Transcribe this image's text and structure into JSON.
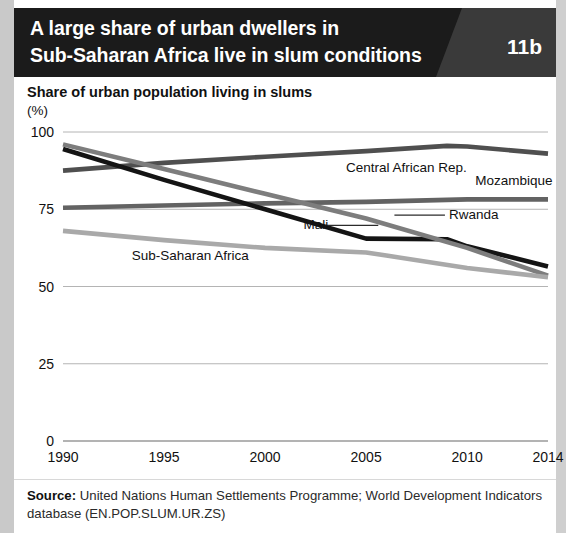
{
  "header": {
    "title_line_1": "A large share of urban dwellers in",
    "title_line_2": "Sub-Saharan Africa live in slum conditions",
    "figure_number": "11b",
    "bar_color": "#1b1b1b",
    "badge_color": "#3a3a3a",
    "text_color": "#ffffff"
  },
  "subtitle": "Share of urban population living in slums",
  "unit": "(%)",
  "source": {
    "label": "Source:",
    "text": " United Nations Human Settlements Programme; World Development Indicators database (EN.POP.SLUM.UR.ZS)"
  },
  "chart_data": {
    "type": "line",
    "title": "Share of urban population living in slums",
    "xlabel": "",
    "ylabel": "(%)",
    "ylim": [
      0,
      100
    ],
    "yticks": [
      0,
      25,
      50,
      75,
      100
    ],
    "xlim": [
      1990,
      2014
    ],
    "xticks": [
      1990,
      1995,
      2000,
      2005,
      2010,
      2014
    ],
    "grid": true,
    "legend": "inline-labels",
    "x": [
      1990,
      1995,
      2000,
      2005,
      2010,
      2014
    ],
    "series": [
      {
        "name": "Central African Rep.",
        "color": "#4f4f4f",
        "label_x": 2004.0,
        "label_y": 87.0,
        "values": [
          87.5,
          90.0,
          92.0,
          93.8,
          95.4,
          93.0
        ],
        "detail_x": [
          1990,
          1995,
          2000,
          2005,
          2009,
          2010,
          2014
        ],
        "detail_y": [
          87.5,
          90.0,
          92.0,
          93.8,
          95.5,
          95.3,
          93.0
        ]
      },
      {
        "name": "Mozambique",
        "color": "#636363",
        "label_x": 2010.4,
        "label_y": 83.0,
        "values": [
          75.5,
          76.2,
          76.9,
          77.4,
          78.2,
          78.2
        ],
        "detail_x": [
          1990,
          1995,
          2000,
          2005,
          2010,
          2014
        ],
        "detail_y": [
          75.5,
          76.2,
          76.9,
          77.4,
          78.2,
          78.2
        ]
      },
      {
        "name": "Mali",
        "color": "#141414",
        "label_x": 2001.9,
        "label_y": 68.5,
        "values": [
          94.5,
          84.5,
          75.0,
          65.5,
          65.2,
          56.5
        ],
        "detail_x": [
          1990,
          1995,
          2000,
          2005,
          2009,
          2010,
          2014
        ],
        "detail_y": [
          94.5,
          84.5,
          75.0,
          65.5,
          65.3,
          63.0,
          56.5
        ]
      },
      {
        "name": "Rwanda",
        "color": "#7d7d7d",
        "label_x": 2009.1,
        "label_y": 71.8,
        "values": [
          96.0,
          88.0,
          80.0,
          72.0,
          62.5,
          53.5
        ],
        "detail_x": [
          1990,
          1995,
          2000,
          2005,
          2010,
          2014
        ],
        "detail_y": [
          96.0,
          88.0,
          80.0,
          72.0,
          62.5,
          53.5
        ]
      },
      {
        "name": "Sub-Saharan Africa",
        "color": "#a9a9a9",
        "label_x": 1993.4,
        "label_y": 58.5,
        "values": [
          68.0,
          65.0,
          62.5,
          61.0,
          56.0,
          53.0
        ],
        "detail_x": [
          1990,
          1995,
          2000,
          2005,
          2006,
          2010,
          2012,
          2014
        ],
        "detail_y": [
          68.0,
          65.0,
          62.5,
          61.0,
          60.0,
          56.0,
          54.5,
          53.0
        ]
      }
    ]
  }
}
